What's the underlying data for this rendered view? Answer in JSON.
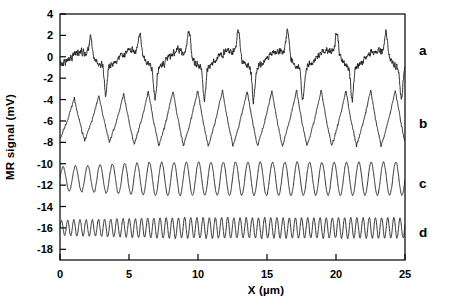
{
  "chart_data": {
    "type": "line",
    "title": "",
    "xlabel": "X (µm)",
    "ylabel": "MR signal (mV)",
    "xlim": [
      0,
      25
    ],
    "ylim": [
      -19,
      4
    ],
    "xticks": [
      0,
      5,
      10,
      15,
      20,
      25
    ],
    "xtick_labels": [
      "0",
      "5",
      "10",
      "15",
      "20",
      "25"
    ],
    "yticks": [
      4,
      2,
      0,
      -2,
      -4,
      -6,
      -8,
      -10,
      -12,
      -14,
      -16,
      -18
    ],
    "ytick_labels": [
      "4",
      "2",
      "0",
      "-2",
      "-4",
      "-6",
      "-8",
      "-10",
      "-12",
      "-14",
      "-16",
      "-18"
    ],
    "grid": false,
    "legend_position": "right-outside",
    "line_color": "#1a1a1a",
    "line_width": 0.9,
    "series": [
      {
        "name": "a",
        "label": "a",
        "offset": 0.0,
        "period": 3.57,
        "amplitude": 2.4,
        "noise": 0.3,
        "waveform": "peaked",
        "label_y": 0.6
      },
      {
        "name": "b",
        "label": "b",
        "offset": -6.0,
        "period": 1.79,
        "amplitude": 2.6,
        "noise": 0.12,
        "waveform": "triangle",
        "label_y": -6.2
      },
      {
        "name": "c",
        "label": "c",
        "offset": -11.4,
        "period": 0.893,
        "amplitude": 1.55,
        "noise": 0.06,
        "waveform": "sine",
        "label_y": -11.8
      },
      {
        "name": "d",
        "label": "d",
        "offset": -16.0,
        "period": 0.446,
        "amplitude": 0.95,
        "noise": 0.05,
        "waveform": "sine",
        "label_y": -16.4
      }
    ]
  },
  "axes": {
    "y_axis_title": "MR signal (mV)",
    "x_axis_title": "X (µm)"
  },
  "curve_labels": {
    "a": "a",
    "b": "b",
    "c": "c",
    "d": "d"
  }
}
